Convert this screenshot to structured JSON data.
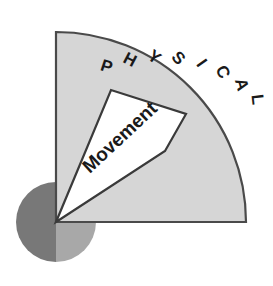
{
  "diagram": {
    "type": "quarter-circle-sector-diagram",
    "background_color": "#ffffff",
    "title": "",
    "outer_sector": {
      "label": "PHYSICAL",
      "fill_color": "#d6d6d6",
      "stroke_color": "#4a4a4a",
      "center_x": 56,
      "center_y": 222,
      "radius": 190,
      "start_angle_deg": 0,
      "end_angle_deg": 90
    },
    "inner_wedge": {
      "label": "Movement",
      "fill_color": "#ffffff",
      "stroke_color": "#3a3a3a",
      "start_angle_deg": 33,
      "end_angle_deg": 58,
      "inner_radius": 0,
      "outer_radius": 130,
      "text_rotation_deg": -43
    },
    "origin_circle": {
      "center_x": 56,
      "center_y": 222,
      "radius": 40,
      "left_half_color": "#787878",
      "right_half_color": "#a8a8a8"
    },
    "curved_text": {
      "characters": [
        "P",
        "H",
        "Y",
        "S",
        "I",
        "C",
        "A",
        "L"
      ],
      "radius": 158,
      "start_angle_deg": 72,
      "angle_step_deg": -9.4,
      "font_size": 17
    }
  }
}
